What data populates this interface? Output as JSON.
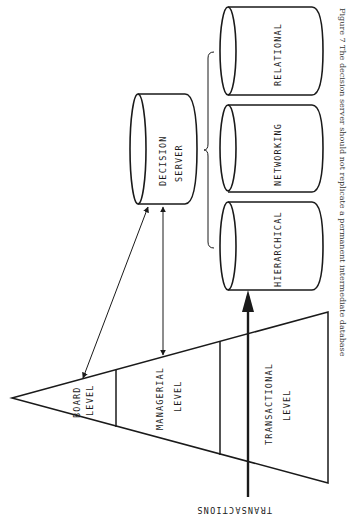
{
  "diagram": {
    "pyramid": {
      "levels": [
        {
          "line1": "BOARD",
          "line2": "LEVEL"
        },
        {
          "line1": "MANAGERIAL",
          "line2": "LEVEL"
        },
        {
          "line1": "TRANSACTIONAL",
          "line2": "LEVEL"
        }
      ]
    },
    "decision_server": {
      "line1": "DECISION",
      "line2": "SERVER"
    },
    "databases": [
      {
        "label": "RELATIONAL"
      },
      {
        "label": "NETWORKING"
      },
      {
        "label": "HIERARCHICAL"
      }
    ],
    "input_label": "TRANSACTIONS",
    "caption": "Figure 7   The decision server should not replicate a permanent intermediate database"
  },
  "colors": {
    "ink": "#1a1a1a",
    "background": "#ffffff"
  }
}
